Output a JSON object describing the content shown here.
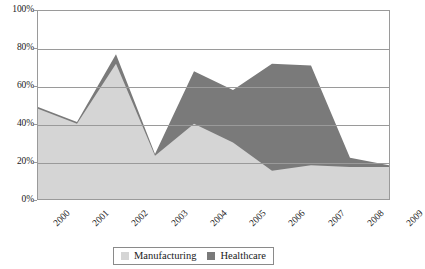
{
  "chart_data": {
    "type": "area",
    "stacked": true,
    "title": "",
    "subtitle": "",
    "xlabel": "",
    "ylabel": "",
    "categories": [
      "2000",
      "2001",
      "2002",
      "2003",
      "2004",
      "2005",
      "2006",
      "2007",
      "2008",
      "2009"
    ],
    "series": [
      {
        "name": "Manufacturing",
        "color": "#d5d5d5",
        "values": [
          48,
          40,
          72,
          23,
          40,
          30,
          15,
          18,
          17,
          17
        ]
      },
      {
        "name": "Healthcare",
        "color": "#7a7a7a",
        "values": [
          1,
          1,
          5,
          1,
          28,
          28,
          57,
          53,
          5,
          1
        ]
      }
    ],
    "totals": [
      49,
      41,
      77,
      24,
      68,
      58,
      72,
      71,
      22,
      18
    ],
    "ylim": [
      0,
      100
    ],
    "yticks": [
      0,
      20,
      40,
      60,
      80,
      100
    ],
    "ytick_labels": [
      "0%",
      "20%",
      "40%",
      "60%",
      "80%",
      "100%"
    ],
    "grid": true,
    "grid_axis": "y",
    "legend_position": "bottom",
    "xtick_rotation": -45,
    "value_suffix": "%"
  },
  "legend": {
    "entries": [
      {
        "label": "Manufacturing",
        "color": "#d5d5d5"
      },
      {
        "label": "Healthcare",
        "color": "#7a7a7a"
      }
    ]
  },
  "colors": {
    "manufacturing": "#d5d5d5",
    "healthcare": "#7a7a7a",
    "axis": "#9a9a9a",
    "text": "#1a1a1a",
    "background": "#ffffff"
  }
}
